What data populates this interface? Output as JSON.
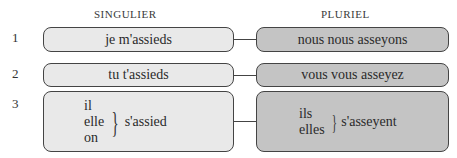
{
  "headers": {
    "singular": "SINGULIER",
    "plural": "PLURIEL"
  },
  "rows": [
    {
      "number": "1",
      "singular": "je m'assieds",
      "plural": "nous nous asseyons"
    },
    {
      "number": "2",
      "singular": "tu t'assieds",
      "plural": "vous vous asseyez"
    },
    {
      "number": "3",
      "singular": {
        "pronouns": [
          "il",
          "elle",
          "on"
        ],
        "verb": "s'assied"
      },
      "plural": {
        "pronouns": [
          "ils",
          "elles"
        ],
        "verb": "s'asseyent"
      }
    }
  ],
  "colors": {
    "singular_fill": "#e9e9e9",
    "plural_fill": "#c4c4c4",
    "border": "#444444"
  }
}
